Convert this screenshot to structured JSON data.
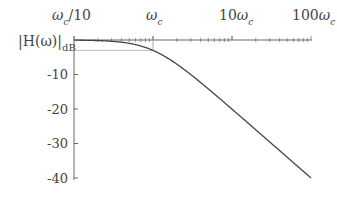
{
  "chart_data": {
    "type": "line",
    "title": "",
    "xlabel": "",
    "ylabel": "|H(ω)|dB",
    "x_scale": "log",
    "x_tick_labels": [
      "ωc/10",
      "ωc",
      "10ωc",
      "100ωc"
    ],
    "x_ticks_rel_wc": [
      0.1,
      1,
      10,
      100
    ],
    "y_ticks": [
      -10,
      -20,
      -30,
      -40
    ],
    "y_tick_labels": [
      "-10",
      "-20",
      "-30",
      "-40"
    ],
    "ylim": [
      -40,
      0
    ],
    "xlim_rel_wc": [
      0.1,
      100
    ],
    "series": [
      {
        "name": "first-order low-pass magnitude",
        "x_rel_wc": [
          0.1,
          0.2,
          0.5,
          1,
          2,
          5,
          10,
          20,
          50,
          100
        ],
        "values_db": [
          -0.04,
          -0.17,
          -0.97,
          -3.01,
          -6.99,
          -14.15,
          -20.04,
          -26.02,
          -33.98,
          -40.0
        ]
      }
    ],
    "annotations": [
      {
        "type": "reference-line",
        "label": "-3 dB",
        "y": -3,
        "x_from_rel_wc": 0.1,
        "x_to_rel_wc": 1,
        "color": "#bbbbbb"
      },
      {
        "type": "marker",
        "label": "ωc",
        "x_rel_wc": 1
      }
    ],
    "grid": false,
    "legend": "none"
  },
  "labels": {
    "x0_main": "ω",
    "x0_sub": "c",
    "x0_suffix": "/10",
    "x1_main": "ω",
    "x1_sub": "c",
    "x2_prefix": "10",
    "x2_main": "ω",
    "x2_sub": "c",
    "x3_prefix": "100",
    "x3_main": "ω",
    "x3_sub": "c",
    "ylabel_main": "|H(ω)|",
    "ylabel_sub": "dB",
    "y10": "-10",
    "y20": "-20",
    "y30": "-30",
    "y40": "-40"
  },
  "colors": {
    "axis": "#555555",
    "curve": "#444444",
    "ref_line": "#bbbbbb"
  }
}
